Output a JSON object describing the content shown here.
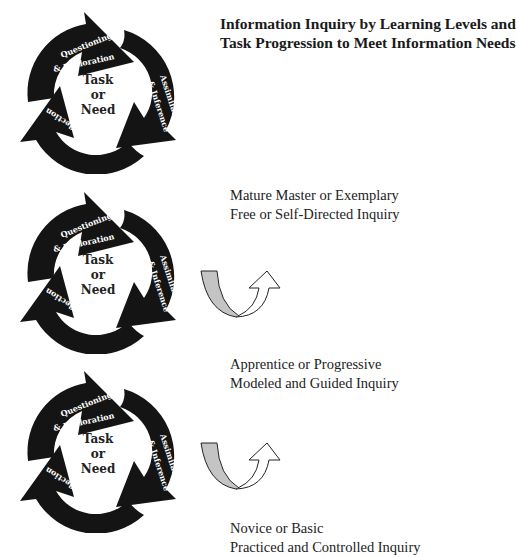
{
  "title": {
    "line1": "Information Inquiry by Learning Levels and",
    "line2": "Task Progression to Meet Information Needs"
  },
  "cycle": {
    "center": [
      "Task",
      "or",
      "Need"
    ],
    "segment_top": [
      "Questioning",
      "& Exploration"
    ],
    "segment_right": [
      "Assimilation",
      "& Inference"
    ],
    "segment_left": "Reflection"
  },
  "levels": [
    {
      "line1": "Mature Master or Exemplary",
      "line2": "Free or Self-Directed Inquiry"
    },
    {
      "line1": "Apprentice or Progressive",
      "line2": "Modeled and Guided Inquiry"
    },
    {
      "line1": "Novice or Basic",
      "line2": "Practiced and Controlled Inquiry"
    }
  ],
  "colors": {
    "cycle_fill": "#141414",
    "arrow_band": "#c4c4c4",
    "text": "#1a1a1a"
  }
}
